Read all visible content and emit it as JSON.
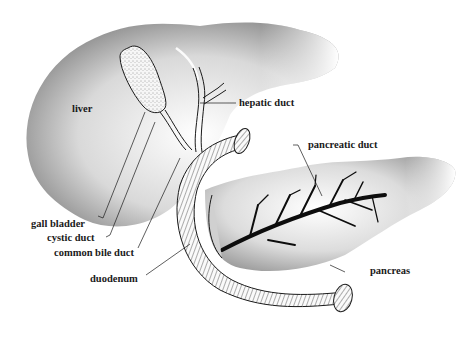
{
  "diagram": {
    "labels": {
      "liver": "liver",
      "hepatic_duct": "hepatic duct",
      "pancreatic_duct": "pancreatic duct",
      "gall_bladder": "gall bladder",
      "cystic_duct": "cystic duct",
      "common_bile_duct": "common bile duct",
      "duodenum": "duodenum",
      "pancreas": "pancreas"
    },
    "colors": {
      "background": "#ffffff",
      "organ_shade_dark": "#6e6e6e",
      "organ_shade_light": "#f4f4f4",
      "line": "#1a1a1a",
      "duct_fill": "#0d0d0d"
    }
  }
}
